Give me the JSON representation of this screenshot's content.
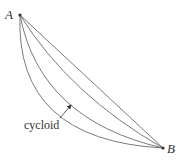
{
  "diagram": {
    "points": [
      {
        "id": "A",
        "label": "A",
        "x": 20,
        "y": 15
      },
      {
        "id": "B",
        "label": "B",
        "x": 163,
        "y": 148
      }
    ],
    "curves": [
      {
        "name": "straight-line",
        "path": "M20,15 L163,148"
      },
      {
        "name": "shallow-curve",
        "path": "M20,15 Q70,95 163,148"
      },
      {
        "name": "cycloid-curve",
        "path": "M20,15 Q40,120 163,148"
      },
      {
        "name": "deep-curve",
        "path": "M20,15 Q15,140 163,148"
      }
    ],
    "annotation": {
      "label": "cycloid",
      "arrow_from": [
        60,
        118
      ],
      "arrow_to": [
        71,
        105
      ]
    },
    "colors": {
      "curve": "#7a7a7a",
      "text": "#333333",
      "point": "#333333"
    }
  }
}
